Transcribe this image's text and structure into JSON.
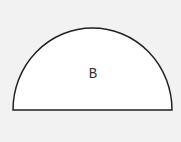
{
  "diagram": {
    "shape": "semicircle",
    "label": "B",
    "stroke_color": "#222222",
    "fill_color": "#ffffff",
    "background_color": "#f2f2f2"
  }
}
